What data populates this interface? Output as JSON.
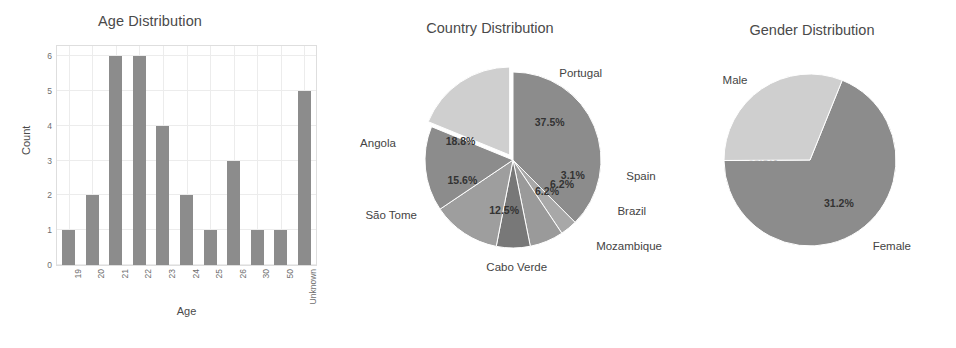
{
  "chart_data": [
    {
      "type": "bar",
      "title": "Age Distribution",
      "xlabel": "Age",
      "ylabel": "Count",
      "categories": [
        "19",
        "20",
        "21",
        "22",
        "23",
        "24",
        "25",
        "26",
        "30",
        "50",
        "Unknown"
      ],
      "values": [
        1,
        2,
        6,
        6,
        4,
        2,
        1,
        3,
        1,
        1,
        5
      ],
      "ylim": [
        0,
        6.3
      ],
      "yticks": [
        "0",
        "1",
        "2",
        "3",
        "4",
        "5",
        "6"
      ],
      "grid": true,
      "legend": "none",
      "bar_color": "#8c8c8c"
    },
    {
      "type": "pie",
      "title": "Country Distribution",
      "labels": [
        "Portugal",
        "Spain",
        "Brazil",
        "Mozambique",
        "Cabo Verde",
        "São Tome",
        "Angola"
      ],
      "percent_labels": [
        "37.5%",
        "3.1%",
        "6.2%",
        "6.2%",
        "12.5%",
        "15.6%",
        "18.8%"
      ],
      "values": [
        37.5,
        3.1,
        6.2,
        6.2,
        12.5,
        15.6,
        18.8
      ],
      "colors": [
        "#8c8c8c",
        "#a8a8a8",
        "#9a9a9a",
        "#787878",
        "#9e9e9e",
        "#8c8c8c",
        "#cfcfcf"
      ],
      "legend": "none"
    },
    {
      "type": "pie",
      "title": "Gender Distribution",
      "labels": [
        "Male",
        "Female"
      ],
      "percent_labels": [
        "68.8%",
        "31.2%"
      ],
      "values": [
        68.8,
        31.2
      ],
      "colors": [
        "#8c8c8c",
        "#cfcfcf"
      ],
      "legend": "none"
    }
  ],
  "bar_chart": {
    "title": "Age Distribution",
    "xlabel": "Age",
    "ylabel": "Count"
  },
  "country_chart": {
    "title": "Country Distribution"
  },
  "gender_chart": {
    "title": "Gender Distribution"
  }
}
